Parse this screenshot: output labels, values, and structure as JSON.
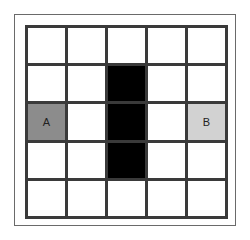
{
  "grid": {
    "rows": 5,
    "cols": 5,
    "colors": {
      "empty": "#ffffff",
      "wall": "#000000",
      "start": "#8c8c8c",
      "goal": "#d2d2d2",
      "line": "#3a3a3a"
    },
    "cells": [
      [
        "empty",
        "empty",
        "empty",
        "empty",
        "empty"
      ],
      [
        "empty",
        "empty",
        "wall",
        "empty",
        "empty"
      ],
      [
        "start",
        "empty",
        "wall",
        "empty",
        "goal"
      ],
      [
        "empty",
        "empty",
        "wall",
        "empty",
        "empty"
      ],
      [
        "empty",
        "empty",
        "empty",
        "empty",
        "empty"
      ]
    ],
    "labels": [
      [
        "",
        "",
        "",
        "",
        ""
      ],
      [
        "",
        "",
        "",
        "",
        ""
      ],
      [
        "A",
        "",
        "",
        "",
        "B"
      ],
      [
        "",
        "",
        "",
        "",
        ""
      ],
      [
        "",
        "",
        "",
        "",
        ""
      ]
    ]
  }
}
